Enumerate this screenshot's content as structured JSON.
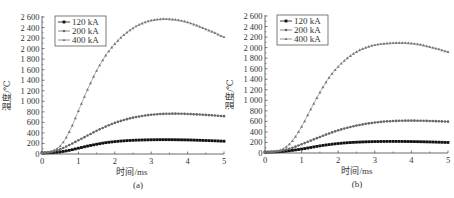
{
  "chart_data": [
    {
      "type": "line",
      "panel_label": "(a)",
      "xlabel": "时间/ms",
      "ylabel": "温度/℃",
      "xlim": [
        0,
        5
      ],
      "ylim": [
        0,
        2600
      ],
      "xticks": [
        0,
        1,
        2,
        3,
        4,
        5
      ],
      "yticks": [
        0,
        200,
        400,
        600,
        800,
        1000,
        1200,
        1400,
        1600,
        1800,
        2000,
        2200,
        2400,
        2600
      ],
      "ytick_labels": [
        "0",
        "200",
        "400",
        "600",
        "800",
        "1 000",
        "1 200",
        "1 400",
        "1 600",
        "1 800",
        "2 000",
        "2 200",
        "2 400",
        "2 600"
      ],
      "grid": false,
      "legend_position": "upper left",
      "x": [
        0,
        0.25,
        0.5,
        0.75,
        1,
        1.25,
        1.5,
        1.75,
        2,
        2.25,
        2.5,
        2.75,
        3,
        3.25,
        3.5,
        3.75,
        4,
        4.25,
        4.5,
        4.75,
        5
      ],
      "series": [
        {
          "name": "120 kA",
          "marker": "square",
          "values": [
            20,
            25,
            40,
            70,
            110,
            150,
            185,
            215,
            235,
            250,
            260,
            266,
            270,
            272,
            272,
            270,
            267,
            262,
            256,
            250,
            243
          ]
        },
        {
          "name": "200 kA",
          "marker": "circle",
          "values": [
            20,
            40,
            90,
            170,
            260,
            350,
            440,
            520,
            590,
            645,
            690,
            722,
            745,
            758,
            765,
            765,
            760,
            752,
            742,
            730,
            718
          ]
        },
        {
          "name": "400 kA",
          "marker": "triangle",
          "values": [
            20,
            50,
            150,
            420,
            820,
            1220,
            1580,
            1870,
            2090,
            2260,
            2390,
            2480,
            2535,
            2560,
            2560,
            2540,
            2500,
            2440,
            2370,
            2300,
            2220
          ]
        }
      ]
    },
    {
      "type": "line",
      "panel_label": "(b)",
      "xlabel": "时间/ms",
      "ylabel": "温度/℃",
      "xlim": [
        0,
        5
      ],
      "ylim": [
        0,
        2600
      ],
      "xticks": [
        0,
        1,
        2,
        3,
        4,
        5
      ],
      "yticks": [
        0,
        200,
        400,
        600,
        800,
        1000,
        1200,
        1400,
        1600,
        1800,
        2000,
        2200,
        2400,
        2600
      ],
      "ytick_labels": [
        "0",
        "200",
        "400",
        "600",
        "800",
        "1 000",
        "1 200",
        "1 400",
        "1 600",
        "1 800",
        "2 000",
        "2 200",
        "2 400",
        "2 600"
      ],
      "grid": false,
      "legend_position": "upper left",
      "x": [
        0,
        0.25,
        0.5,
        0.75,
        1,
        1.25,
        1.5,
        1.75,
        2,
        2.25,
        2.5,
        2.75,
        3,
        3.25,
        3.5,
        3.75,
        4,
        4.25,
        4.5,
        4.75,
        5
      ],
      "series": [
        {
          "name": "120 kA",
          "marker": "square",
          "values": [
            15,
            20,
            30,
            50,
            75,
            105,
            135,
            160,
            180,
            195,
            205,
            212,
            217,
            219,
            220,
            219,
            217,
            214,
            210,
            205,
            200
          ]
        },
        {
          "name": "200 kA",
          "marker": "circle",
          "values": [
            15,
            25,
            50,
            100,
            165,
            235,
            305,
            370,
            430,
            480,
            520,
            553,
            578,
            596,
            607,
            613,
            614,
            612,
            608,
            602,
            595
          ]
        },
        {
          "name": "400 kA",
          "marker": "triangle",
          "values": [
            15,
            30,
            80,
            230,
            500,
            830,
            1150,
            1430,
            1640,
            1800,
            1920,
            2000,
            2050,
            2075,
            2088,
            2090,
            2080,
            2055,
            2015,
            1970,
            1920
          ]
        }
      ]
    }
  ]
}
